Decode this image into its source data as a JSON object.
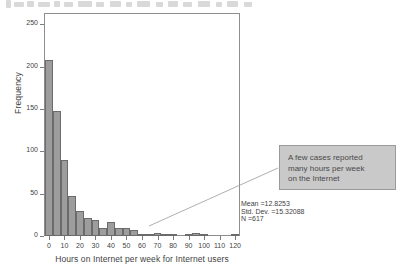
{
  "chart_data": {
    "type": "bar",
    "title": "",
    "subtitle": "",
    "xlabel": "Hours on Internet per week for Internet users",
    "ylabel": "Frequency",
    "xlim": [
      -2.5,
      122.5
    ],
    "ylim": [
      0,
      262
    ],
    "grid": false,
    "legend": null,
    "bin_width": 5,
    "bar_fill_color": "#9d9d9d",
    "bar_edge_color": "#6b6b6b",
    "x_ticks": [
      0,
      10,
      20,
      30,
      40,
      50,
      60,
      70,
      80,
      90,
      100,
      110,
      120
    ],
    "y_ticks": [
      0,
      50,
      100,
      150,
      200,
      250
    ],
    "bin_centers": [
      0,
      5,
      10,
      15,
      20,
      25,
      30,
      35,
      40,
      45,
      50,
      55,
      60,
      65,
      70,
      75,
      80,
      85,
      90,
      95,
      100,
      105,
      110,
      120
    ],
    "values": [
      208,
      148,
      90,
      47,
      30,
      21,
      19,
      10,
      16,
      9,
      9,
      7,
      2,
      1,
      3,
      2,
      1,
      0,
      1,
      3,
      1,
      0,
      0,
      1
    ],
    "categories": [
      "0",
      "5",
      "10",
      "15",
      "20",
      "25",
      "30",
      "35",
      "40",
      "45",
      "50",
      "55",
      "60",
      "65",
      "70",
      "75",
      "80",
      "85",
      "90",
      "95",
      "100",
      "105",
      "110",
      "120"
    ]
  },
  "statistics": {
    "mean": "Mean =12.8253",
    "std_dev": "Std. Dev. =15.32088",
    "n": "N =617"
  },
  "annotation": {
    "line1": "A few cases reported",
    "line2": "many hours per week",
    "line3": "on the Internet",
    "box_fill_color": "#c9c9c9",
    "box_border_color": "#9a9a9a"
  }
}
